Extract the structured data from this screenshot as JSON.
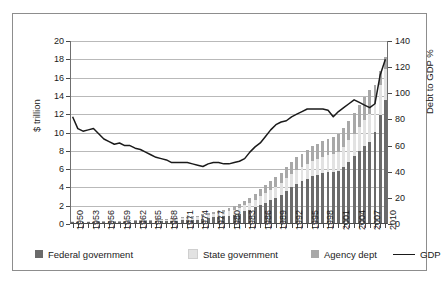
{
  "chart_data": {
    "type": "bar",
    "title": "",
    "subtitle": "",
    "xlabel": "",
    "ylabel": "$ trillion",
    "y2label": "Debt to GDP %",
    "ylim": [
      0,
      20
    ],
    "y2lim": [
      0,
      140
    ],
    "yticks": [
      0,
      2,
      4,
      6,
      8,
      10,
      12,
      14,
      16,
      18,
      20
    ],
    "y2ticks": [
      0,
      20,
      40,
      60,
      80,
      100,
      120,
      140
    ],
    "grid": true,
    "legend_position": "bottom",
    "x": [
      1950,
      1951,
      1952,
      1953,
      1954,
      1955,
      1956,
      1957,
      1958,
      1959,
      1960,
      1961,
      1962,
      1963,
      1964,
      1965,
      1966,
      1967,
      1968,
      1969,
      1970,
      1971,
      1972,
      1973,
      1974,
      1975,
      1976,
      1977,
      1978,
      1979,
      1980,
      1981,
      1982,
      1983,
      1984,
      1985,
      1986,
      1987,
      1988,
      1989,
      1990,
      1991,
      1992,
      1993,
      1994,
      1995,
      1996,
      1997,
      1998,
      1999,
      2000,
      2001,
      2002,
      2003,
      2004,
      2005,
      2006,
      2007,
      2008,
      2009,
      2010
    ],
    "xtick_labels": [
      "1950",
      "1953",
      "1956",
      "1959",
      "1962",
      "1965",
      "1968",
      "1971",
      "1974",
      "1977",
      "1980",
      "1983",
      "1986",
      "1989",
      "1992",
      "1995",
      "1998",
      "2001",
      "2004",
      "2007",
      "2010"
    ],
    "xtick_step": 3,
    "series": [
      {
        "name": "Federal government",
        "color": "#6b6b6b",
        "stack": "bars",
        "axis": "left",
        "values": [
          0.26,
          0.26,
          0.26,
          0.27,
          0.27,
          0.27,
          0.27,
          0.27,
          0.28,
          0.29,
          0.29,
          0.29,
          0.3,
          0.31,
          0.32,
          0.32,
          0.33,
          0.34,
          0.37,
          0.37,
          0.38,
          0.41,
          0.44,
          0.47,
          0.49,
          0.58,
          0.65,
          0.72,
          0.78,
          0.83,
          0.91,
          1.0,
          1.14,
          1.38,
          1.57,
          1.82,
          2.12,
          2.35,
          2.6,
          2.87,
          3.21,
          3.66,
          4.06,
          4.41,
          4.69,
          4.97,
          5.22,
          5.41,
          5.53,
          5.66,
          5.67,
          5.81,
          6.23,
          6.78,
          7.38,
          7.93,
          8.51,
          9.01,
          10.02,
          11.91,
          13.56
        ]
      },
      {
        "name": "State government",
        "color": "#e2e2e2",
        "stack": "bars",
        "axis": "left",
        "values": [
          0.03,
          0.03,
          0.04,
          0.04,
          0.05,
          0.05,
          0.06,
          0.06,
          0.07,
          0.08,
          0.08,
          0.09,
          0.1,
          0.11,
          0.12,
          0.13,
          0.14,
          0.16,
          0.17,
          0.19,
          0.21,
          0.24,
          0.26,
          0.29,
          0.31,
          0.34,
          0.37,
          0.4,
          0.44,
          0.47,
          0.51,
          0.55,
          0.6,
          0.66,
          0.72,
          0.82,
          0.95,
          1.03,
          1.09,
          1.16,
          1.25,
          1.34,
          1.42,
          1.5,
          1.56,
          1.63,
          1.69,
          1.74,
          1.8,
          1.87,
          1.95,
          2.06,
          2.2,
          2.35,
          2.5,
          2.65,
          2.82,
          2.97,
          3.12,
          3.26,
          3.38
        ]
      },
      {
        "name": "Agency dept",
        "color": "#a8a8a8",
        "stack": "bars",
        "axis": "left",
        "values": [
          0.0,
          0.0,
          0.0,
          0.0,
          0.0,
          0.01,
          0.01,
          0.01,
          0.01,
          0.01,
          0.01,
          0.02,
          0.02,
          0.02,
          0.03,
          0.03,
          0.04,
          0.04,
          0.05,
          0.06,
          0.07,
          0.08,
          0.09,
          0.11,
          0.13,
          0.15,
          0.17,
          0.2,
          0.24,
          0.28,
          0.32,
          0.37,
          0.42,
          0.48,
          0.56,
          0.66,
          0.78,
          0.88,
          0.97,
          1.06,
          1.17,
          1.25,
          1.32,
          1.38,
          1.45,
          1.52,
          1.58,
          1.64,
          1.7,
          1.78,
          1.86,
          1.95,
          2.05,
          2.16,
          2.29,
          2.42,
          2.56,
          2.7,
          2.1,
          1.55,
          1.28
        ]
      },
      {
        "name": "GDP",
        "color": "#1a1a1a",
        "type": "line",
        "axis": "right",
        "unit": "Debt to GDP %",
        "values": [
          82,
          73,
          71,
          72,
          73,
          69,
          65,
          63,
          61,
          62,
          60,
          60,
          58,
          57,
          55,
          53,
          51,
          50,
          49,
          47,
          47,
          47,
          47,
          46,
          45,
          44,
          46,
          47,
          47,
          46,
          46,
          47,
          48,
          50,
          55,
          59,
          62,
          67,
          72,
          76,
          78,
          79,
          82,
          84,
          86,
          88,
          88,
          88,
          88,
          87,
          82,
          86,
          89,
          92,
          95,
          93,
          91,
          89,
          92,
          114,
          126
        ]
      }
    ]
  },
  "legend": {
    "items": [
      {
        "label": "Federal government",
        "color": "#6b6b6b",
        "marker": "swatch"
      },
      {
        "label": "State government",
        "color": "#e2e2e2",
        "marker": "swatch"
      },
      {
        "label": "Agency dept",
        "color": "#a8a8a8",
        "marker": "swatch"
      },
      {
        "label": "GDP",
        "color": "#1a1a1a",
        "marker": "line"
      }
    ]
  }
}
